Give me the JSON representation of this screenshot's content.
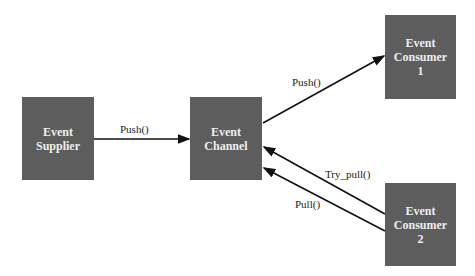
{
  "nodes": {
    "supplier": {
      "line1": "Event",
      "line2": "Supplier",
      "line3": ""
    },
    "channel": {
      "line1": "Event",
      "line2": "Channel",
      "line3": ""
    },
    "consumer1": {
      "line1": "Event",
      "line2": "Consumer",
      "line3": "1"
    },
    "consumer2": {
      "line1": "Event",
      "line2": "Consumer",
      "line3": "2"
    }
  },
  "edges": {
    "supplier_push": "Push()",
    "consumer1_push": "Push()",
    "consumer2_try_pull": "Try_pull()",
    "consumer2_pull": "Pull()"
  },
  "colors": {
    "box": "#5d5d5d",
    "box_text": "#eeeeee",
    "edge": "#111111"
  }
}
